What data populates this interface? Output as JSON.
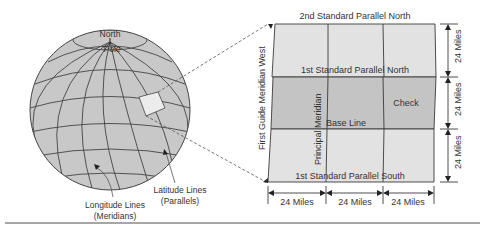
{
  "globe": {
    "pole_label_1": "North",
    "pole_label_2": "Pole",
    "longitude_label_1": "Longitude Lines",
    "longitude_label_2": "(Meridians)",
    "latitude_label_1": "Latitude Lines",
    "latitude_label_2": "(Parallels)"
  },
  "grid": {
    "top_parallel": "2nd Standard Parallel North",
    "first_north": "1st Standard Parallel North",
    "base_line": "Base Line",
    "check": "Check",
    "first_south": "1st Standard Parallel South",
    "principal_meridian": "Principal Meridian",
    "guide_meridian": "First Guide Meridian West"
  },
  "dimensions": {
    "vertical": [
      "24 Miles",
      "24 Miles",
      "24 Miles"
    ],
    "horizontal": [
      "24 Miles",
      "24 Miles",
      "24 Miles"
    ]
  },
  "colors": {
    "globe_fill": "#c8c8c8",
    "light_panel": "#e2e2e2",
    "dark_panel": "#c4c4c4",
    "line": "#3a3a3a",
    "text": "#333333"
  }
}
